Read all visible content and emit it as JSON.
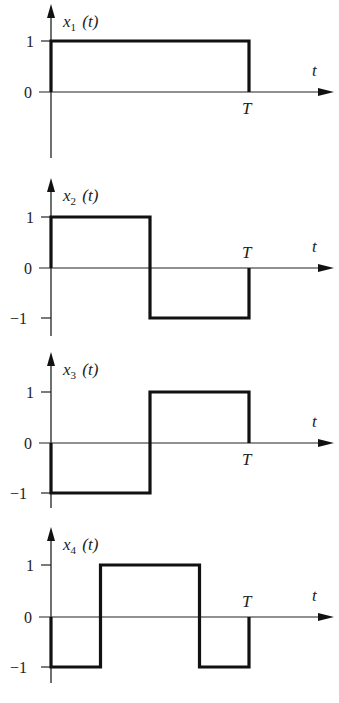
{
  "chart_data": [
    {
      "type": "line",
      "title": "x1(t)",
      "ylabel": "x1(t)",
      "xlabel": "t",
      "xticks": [
        "T"
      ],
      "yticks": [
        "1",
        "0"
      ],
      "ylim": [
        0,
        1
      ],
      "segments": [
        {
          "t_start": 0,
          "t_end": 1,
          "value": 1
        }
      ],
      "x_in_units_of_T": true
    },
    {
      "type": "line",
      "title": "x2(t)",
      "ylabel": "x2(t)",
      "xlabel": "t",
      "xticks": [
        "T"
      ],
      "yticks": [
        "1",
        "0",
        "−1"
      ],
      "ylim": [
        -1,
        1
      ],
      "segments": [
        {
          "t_start": 0,
          "t_end": 0.5,
          "value": 1
        },
        {
          "t_start": 0.5,
          "t_end": 1,
          "value": -1
        }
      ],
      "x_in_units_of_T": true
    },
    {
      "type": "line",
      "title": "x3(t)",
      "ylabel": "x3(t)",
      "xlabel": "t",
      "xticks": [
        "T"
      ],
      "yticks": [
        "1",
        "0",
        "−1"
      ],
      "ylim": [
        -1,
        1
      ],
      "segments": [
        {
          "t_start": 0,
          "t_end": 0.5,
          "value": -1
        },
        {
          "t_start": 0.5,
          "t_end": 1,
          "value": 1
        }
      ],
      "x_in_units_of_T": true
    },
    {
      "type": "line",
      "title": "x4(t)",
      "ylabel": "x4(t)",
      "xlabel": "t",
      "xticks": [
        "T"
      ],
      "yticks": [
        "1",
        "0",
        "−1"
      ],
      "ylim": [
        -1,
        1
      ],
      "segments": [
        {
          "t_start": 0,
          "t_end": 0.25,
          "value": -1
        },
        {
          "t_start": 0.25,
          "t_end": 0.75,
          "value": 1
        },
        {
          "t_start": 0.75,
          "t_end": 1,
          "value": -1
        }
      ],
      "x_in_units_of_T": true
    }
  ],
  "plots": [
    {
      "name": "x",
      "sub": "1",
      "arg": "(t)",
      "t_label": "t",
      "T_label": "T",
      "y1": "1",
      "y0": "0",
      "ym1": ""
    },
    {
      "name": "x",
      "sub": "2",
      "arg": "(t)",
      "t_label": "t",
      "T_label": "T",
      "y1": "1",
      "y0": "0",
      "ym1": "−1"
    },
    {
      "name": "x",
      "sub": "3",
      "arg": "(t)",
      "t_label": "t",
      "T_label": "T",
      "y1": "1",
      "y0": "0",
      "ym1": "−1"
    },
    {
      "name": "x",
      "sub": "4",
      "arg": "(t)",
      "t_label": "t",
      "T_label": "T",
      "y1": "1",
      "y0": "0",
      "ym1": "−1"
    }
  ],
  "colors": {
    "ink": "#111111",
    "background": "#ffffff"
  }
}
